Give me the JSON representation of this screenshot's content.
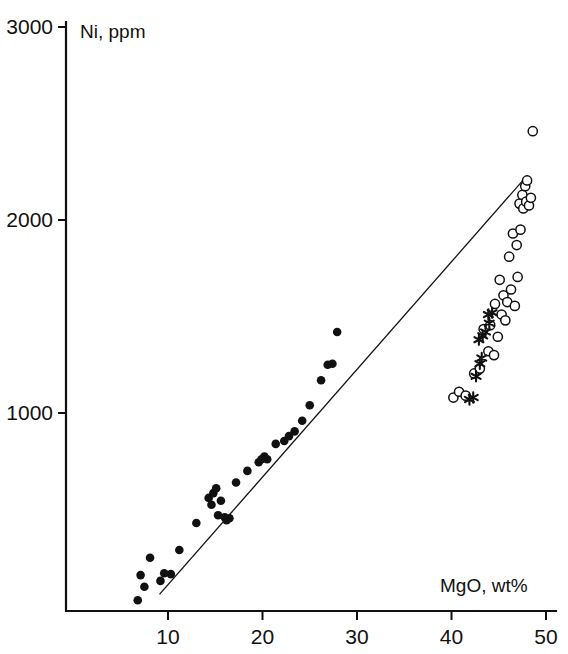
{
  "chart_data": {
    "type": "scatter",
    "title": "",
    "xlabel": "MgO, wt%",
    "ylabel": "Ni, ppm",
    "xlim": [
      0,
      50
    ],
    "ylim": [
      0,
      3000
    ],
    "xticks": [
      10,
      20,
      30,
      40,
      50
    ],
    "yticks": [
      1000,
      2000,
      3000
    ],
    "xtick_labels": [
      "10",
      "20",
      "30",
      "40",
      "50"
    ],
    "ytick_labels": [
      "1000",
      "2000",
      "3000"
    ],
    "grid": false,
    "legend": "none",
    "legend_position": "none",
    "annotations": [],
    "trend_line": {
      "name": "regression line",
      "x_start": 9.1,
      "y_start": 60,
      "x_end": 48.0,
      "y_end": 2230
    },
    "series": [
      {
        "name": "filled circles",
        "marker": "filled-circle",
        "color": "#111111",
        "points": [
          [
            6.8,
            30
          ],
          [
            7.1,
            160
          ],
          [
            7.5,
            100
          ],
          [
            8.1,
            250
          ],
          [
            9.2,
            130
          ],
          [
            9.6,
            170
          ],
          [
            10.3,
            165
          ],
          [
            11.2,
            290
          ],
          [
            13.0,
            430
          ],
          [
            14.3,
            560
          ],
          [
            14.6,
            525
          ],
          [
            14.8,
            585
          ],
          [
            15.1,
            610
          ],
          [
            15.3,
            470
          ],
          [
            15.6,
            545
          ],
          [
            16.0,
            460
          ],
          [
            16.2,
            445
          ],
          [
            16.5,
            455
          ],
          [
            17.2,
            640
          ],
          [
            18.4,
            700
          ],
          [
            19.6,
            745
          ],
          [
            19.9,
            760
          ],
          [
            20.2,
            775
          ],
          [
            20.5,
            760
          ],
          [
            21.4,
            840
          ],
          [
            22.3,
            855
          ],
          [
            22.8,
            880
          ],
          [
            23.4,
            905
          ],
          [
            24.2,
            960
          ],
          [
            25.0,
            1040
          ],
          [
            26.2,
            1170
          ],
          [
            26.9,
            1250
          ],
          [
            27.4,
            1255
          ],
          [
            27.9,
            1420
          ]
        ]
      },
      {
        "name": "open circles",
        "marker": "open-circle",
        "color": "#111111",
        "points": [
          [
            40.2,
            1080
          ],
          [
            40.8,
            1110
          ],
          [
            41.5,
            1090
          ],
          [
            42.4,
            1205
          ],
          [
            43.0,
            1230
          ],
          [
            43.4,
            1435
          ],
          [
            43.9,
            1320
          ],
          [
            44.1,
            1455
          ],
          [
            44.5,
            1300
          ],
          [
            44.6,
            1565
          ],
          [
            44.9,
            1395
          ],
          [
            45.1,
            1690
          ],
          [
            45.3,
            1510
          ],
          [
            45.5,
            1610
          ],
          [
            45.7,
            1480
          ],
          [
            45.9,
            1575
          ],
          [
            46.1,
            1810
          ],
          [
            46.3,
            1640
          ],
          [
            46.5,
            1930
          ],
          [
            46.7,
            1555
          ],
          [
            46.9,
            1870
          ],
          [
            47.0,
            1705
          ],
          [
            47.2,
            2085
          ],
          [
            47.3,
            1950
          ],
          [
            47.5,
            2130
          ],
          [
            47.6,
            2060
          ],
          [
            47.8,
            2175
          ],
          [
            47.9,
            2095
          ],
          [
            48.0,
            2205
          ],
          [
            48.2,
            2075
          ],
          [
            48.4,
            2115
          ],
          [
            48.6,
            2460
          ]
        ]
      },
      {
        "name": "stars",
        "marker": "star",
        "color": "#111111",
        "points": [
          [
            41.9,
            1070
          ],
          [
            42.3,
            1080
          ],
          [
            42.6,
            1190
          ],
          [
            43.0,
            1255
          ],
          [
            43.2,
            1285
          ],
          [
            42.9,
            1380
          ],
          [
            43.3,
            1400
          ],
          [
            43.6,
            1420
          ],
          [
            44.0,
            1465
          ],
          [
            43.9,
            1510
          ],
          [
            44.3,
            1520
          ]
        ]
      }
    ]
  }
}
